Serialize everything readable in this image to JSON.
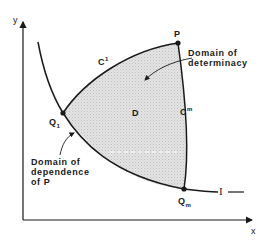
{
  "diagram": {
    "axes": {
      "x_label": "x",
      "y_label": "y"
    },
    "points": {
      "P": "P",
      "Q1": {
        "base": "Q",
        "sub": "1"
      },
      "Qm": {
        "base": "Q",
        "sub": "m"
      }
    },
    "curves": {
      "C1": {
        "base": "C",
        "sup": "1"
      },
      "Cm": {
        "base": "C",
        "sup": "m"
      },
      "I": "I"
    },
    "region_label": "D",
    "annotations": {
      "determinacy": [
        "Domain of",
        "determinacy"
      ],
      "dependence": [
        "Domain of",
        "dependence",
        "of P"
      ]
    },
    "colors": {
      "line": "#1a1a1a",
      "shade": "#d9d9d9",
      "dash": "#ffffff"
    }
  }
}
